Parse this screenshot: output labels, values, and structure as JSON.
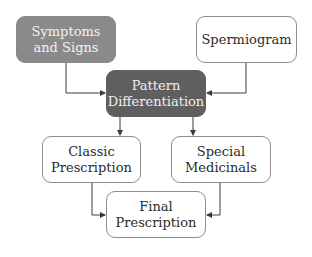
{
  "diagram": {
    "nodes": [
      {
        "id": "symptoms",
        "label": "Symptoms\nand Signs",
        "style": "gray",
        "x": 16,
        "y": 16,
        "w": 100,
        "h": 47
      },
      {
        "id": "spermiogram",
        "label": "Spermiogram",
        "style": "white",
        "x": 196,
        "y": 16,
        "w": 101,
        "h": 47
      },
      {
        "id": "pattern",
        "label": "Pattern\nDifferentiation",
        "style": "dark",
        "x": 106,
        "y": 70,
        "w": 100,
        "h": 47
      },
      {
        "id": "classic",
        "label": "Classic\nPrescription",
        "style": "white",
        "x": 42,
        "y": 136,
        "w": 99,
        "h": 47
      },
      {
        "id": "special",
        "label": "Special\nMedicinals",
        "style": "white",
        "x": 171,
        "y": 136,
        "w": 100,
        "h": 47
      },
      {
        "id": "final",
        "label": "Final\nPrescription",
        "style": "white",
        "x": 106,
        "y": 191,
        "w": 100,
        "h": 47
      }
    ],
    "edges": [
      {
        "from": "symptoms",
        "to": "pattern"
      },
      {
        "from": "spermiogram",
        "to": "pattern"
      },
      {
        "from": "pattern",
        "to": "classic"
      },
      {
        "from": "pattern",
        "to": "special"
      },
      {
        "from": "classic",
        "to": "final"
      },
      {
        "from": "special",
        "to": "final"
      }
    ],
    "colors": {
      "gray_fill": "#8a8a8a",
      "dark_fill": "#5f5f5f",
      "border": "#8c8c8c",
      "line": "#3a3a3a"
    }
  }
}
